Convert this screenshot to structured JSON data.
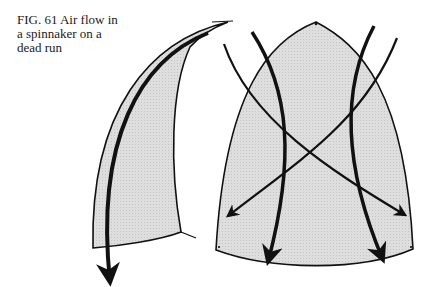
{
  "figure": {
    "caption_lines": [
      "FIG. 61  Air flow in",
      "a spinnaker on a",
      "dead run"
    ],
    "subject": "Air flow in a spinnaker on a dead run",
    "elements": {
      "side_view_sail": "spinnaker-side-profile",
      "front_view_sail": "spinnaker-front-view",
      "airflow_arrows": 5
    },
    "colors": {
      "sail_fill": "#d9d9d9",
      "line": "#111111",
      "background": "#ffffff"
    }
  }
}
